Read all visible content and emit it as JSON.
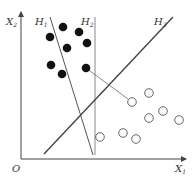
{
  "diagram": {
    "title": "",
    "axes": {
      "origin_label": "O",
      "x_label": "X",
      "x_sub": "1",
      "y_label": "X",
      "y_sub": "2"
    },
    "lines": [
      {
        "name": "H",
        "sub": "1",
        "x1": 50,
        "y1": 17,
        "x2": 93,
        "y2": 155
      },
      {
        "name": "H",
        "sub": "2",
        "x1": 95,
        "y1": 17,
        "x2": 95,
        "y2": 155
      },
      {
        "name": "H",
        "sub": "3",
        "x1": 44,
        "y1": 154,
        "x2": 173,
        "y2": 17
      }
    ],
    "class_filled": [
      [
        50,
        37
      ],
      [
        63,
        27
      ],
      [
        79,
        32
      ],
      [
        87,
        43
      ],
      [
        67,
        48
      ],
      [
        51,
        65
      ],
      [
        62,
        74
      ],
      [
        86,
        68
      ]
    ],
    "class_open": [
      [
        132,
        102
      ],
      [
        149,
        93
      ],
      [
        149,
        118
      ],
      [
        163,
        111
      ],
      [
        179,
        120
      ],
      [
        100,
        137
      ],
      [
        123,
        133
      ],
      [
        136,
        139
      ]
    ],
    "colors": {
      "axis": "#444444",
      "line": "#555555",
      "filled": "#111111",
      "open_stroke": "#555555"
    }
  }
}
